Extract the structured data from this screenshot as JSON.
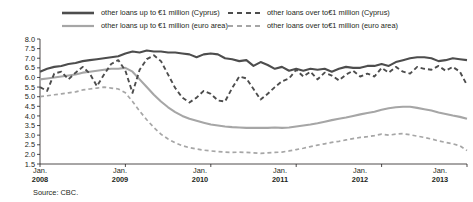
{
  "legend": {
    "entries": [
      {
        "label": "other loans up to €1 million (Cyprus)",
        "style": "solid-dark",
        "color": "#4d4d4d",
        "icon": "legend-line-solid-dark"
      },
      {
        "label": "other loans up to €1 million (euro area)",
        "style": "solid-light",
        "color": "#a6a6a6",
        "icon": "legend-line-solid-light"
      },
      {
        "label": "other loans over to€1 million (Cyprus)",
        "style": "dashed-dark",
        "color": "#4d4d4d",
        "icon": "legend-line-dashed-dark"
      },
      {
        "label": "other loans over  to€1 million (euro area)",
        "style": "dashed-light",
        "color": "#a6a6a6",
        "icon": "legend-line-dashed-light"
      }
    ]
  },
  "source": {
    "text": "Source: CBC."
  },
  "axis": {
    "y_ticks": [
      "8.0",
      "7.5",
      "7.0",
      "6.5",
      "6.0",
      "5.5",
      "5.0",
      "4.5",
      "4.0",
      "3.5",
      "3.0",
      "2.5",
      "2.0",
      "1.5"
    ],
    "x_ticks": [
      {
        "month": "Jan.",
        "year": "2008"
      },
      {
        "month": "Jan.",
        "year": "2009"
      },
      {
        "month": "Jan.",
        "year": "2010"
      },
      {
        "month": "Jan.",
        "year": "2011"
      },
      {
        "month": "Jan.",
        "year": "2012"
      },
      {
        "month": "Jan.",
        "year": "2013"
      }
    ]
  },
  "chart_data": {
    "type": "line",
    "title": "",
    "xlabel": "",
    "ylabel": "",
    "ylim": [
      1.5,
      8.0
    ],
    "ytick_step": 0.5,
    "grid": false,
    "legend_position": "top",
    "x_start": "2008-01",
    "x_end": "2013-01",
    "x_frequency": "monthly",
    "x": [
      "2008-01",
      "2008-02",
      "2008-03",
      "2008-04",
      "2008-05",
      "2008-06",
      "2008-07",
      "2008-08",
      "2008-09",
      "2008-10",
      "2008-11",
      "2008-12",
      "2009-01",
      "2009-02",
      "2009-03",
      "2009-04",
      "2009-05",
      "2009-06",
      "2009-07",
      "2009-08",
      "2009-09",
      "2009-10",
      "2009-11",
      "2009-12",
      "2010-01",
      "2010-02",
      "2010-03",
      "2010-04",
      "2010-05",
      "2010-06",
      "2010-07",
      "2010-08",
      "2010-09",
      "2010-10",
      "2010-11",
      "2010-12",
      "2011-01",
      "2011-02",
      "2011-03",
      "2011-04",
      "2011-05",
      "2011-06",
      "2011-07",
      "2011-08",
      "2011-09",
      "2011-10",
      "2011-11",
      "2011-12",
      "2012-01",
      "2012-02",
      "2012-03",
      "2012-04",
      "2012-05",
      "2012-06",
      "2012-07",
      "2012-08",
      "2012-09",
      "2012-10",
      "2012-11",
      "2012-12",
      "2013-01"
    ],
    "series": [
      {
        "name": "other loans up to €1 million (Cyprus)",
        "style": "solid",
        "color": "#4d4d4d",
        "width": 2.1,
        "values": [
          6.3,
          6.45,
          6.55,
          6.6,
          6.7,
          6.75,
          6.85,
          6.9,
          6.95,
          7.0,
          7.05,
          7.1,
          7.25,
          7.35,
          7.3,
          7.4,
          7.35,
          7.35,
          7.3,
          7.3,
          7.25,
          7.2,
          7.05,
          7.2,
          7.25,
          7.2,
          7.0,
          6.95,
          6.85,
          6.9,
          6.6,
          6.8,
          6.65,
          6.45,
          6.55,
          6.35,
          6.45,
          6.35,
          6.45,
          6.4,
          6.45,
          6.3,
          6.45,
          6.55,
          6.5,
          6.5,
          6.6,
          6.6,
          6.7,
          6.6,
          6.8,
          6.9,
          7.0,
          7.05,
          7.05,
          7.0,
          6.85,
          6.9,
          7.0,
          6.95,
          6.9
        ]
      },
      {
        "name": "other loans up to €1 million (euro area)",
        "style": "solid",
        "color": "#a6a6a6",
        "width": 2.1,
        "values": [
          5.9,
          5.95,
          6.0,
          6.05,
          6.1,
          6.15,
          6.25,
          6.3,
          6.35,
          6.4,
          6.45,
          6.45,
          6.5,
          6.3,
          5.9,
          5.5,
          5.1,
          4.75,
          4.45,
          4.2,
          4.0,
          3.85,
          3.75,
          3.65,
          3.55,
          3.5,
          3.45,
          3.42,
          3.4,
          3.38,
          3.38,
          3.38,
          3.38,
          3.4,
          3.38,
          3.4,
          3.45,
          3.5,
          3.55,
          3.62,
          3.7,
          3.78,
          3.85,
          3.92,
          4.0,
          4.08,
          4.15,
          4.22,
          4.32,
          4.4,
          4.45,
          4.48,
          4.48,
          4.42,
          4.35,
          4.28,
          4.18,
          4.1,
          4.02,
          3.95,
          3.85
        ]
      },
      {
        "name": "other loans over to€1 million (Cyprus)",
        "style": "dashed",
        "color": "#4d4d4d",
        "width": 1.9,
        "values": [
          5.5,
          5.3,
          6.2,
          6.3,
          5.9,
          6.25,
          6.55,
          6.2,
          5.55,
          6.15,
          6.7,
          6.9,
          6.35,
          5.2,
          6.4,
          6.95,
          7.15,
          6.85,
          6.15,
          5.45,
          4.95,
          4.7,
          4.95,
          5.3,
          5.15,
          4.8,
          4.75,
          5.45,
          6.05,
          5.95,
          5.4,
          4.85,
          5.15,
          5.5,
          5.8,
          5.95,
          6.4,
          6.05,
          6.3,
          5.9,
          6.25,
          6.1,
          5.85,
          6.15,
          6.35,
          6.05,
          6.2,
          6.05,
          6.5,
          6.25,
          6.55,
          6.3,
          6.2,
          6.55,
          6.45,
          6.4,
          6.6,
          6.35,
          6.55,
          6.3,
          5.6
        ]
      },
      {
        "name": "other loans over  to€1 million (euro area)",
        "style": "dashed",
        "color": "#a6a6a6",
        "width": 1.7,
        "values": [
          5.0,
          5.05,
          5.1,
          5.15,
          5.2,
          5.25,
          5.35,
          5.4,
          5.45,
          5.5,
          5.45,
          5.4,
          5.2,
          4.75,
          4.25,
          3.8,
          3.4,
          3.05,
          2.8,
          2.6,
          2.45,
          2.35,
          2.28,
          2.22,
          2.18,
          2.15,
          2.12,
          2.1,
          2.12,
          2.1,
          2.08,
          2.05,
          2.08,
          2.1,
          2.12,
          2.18,
          2.25,
          2.32,
          2.4,
          2.48,
          2.55,
          2.62,
          2.68,
          2.75,
          2.82,
          2.88,
          2.92,
          2.98,
          3.05,
          3.0,
          3.05,
          3.08,
          3.02,
          2.95,
          2.88,
          2.8,
          2.7,
          2.62,
          2.55,
          2.45,
          2.2
        ]
      }
    ]
  }
}
